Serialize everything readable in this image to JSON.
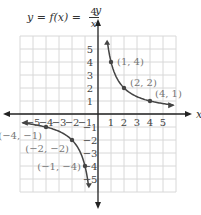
{
  "equation": {
    "lhs": "y = f(x) =",
    "numerator": "4",
    "denominator": "x"
  },
  "axes": {
    "x_label": "x",
    "y_label": "y",
    "x_ticks_pos": [
      "1",
      "2",
      "3",
      "4",
      "5"
    ],
    "x_ticks_neg": [
      "−5",
      "−4",
      "−3",
      "−2",
      "−1"
    ],
    "y_ticks_pos": [
      "1",
      "2",
      "3",
      "4",
      "5"
    ],
    "y_ticks_neg": [
      "−1",
      "−2",
      "−3",
      "−4",
      "−5"
    ]
  },
  "points": [
    {
      "label": "(1, 4)",
      "x": 1,
      "y": 4
    },
    {
      "label": "(2, 2)",
      "x": 2,
      "y": 2
    },
    {
      "label": "(4, 1)",
      "x": 4,
      "y": 1
    },
    {
      "label": "(−4, −1)",
      "x": -4,
      "y": -1
    },
    {
      "label": "(−2, −2)",
      "x": -2,
      "y": -2
    },
    {
      "label": "(−1, −4)",
      "x": -1,
      "y": -4
    }
  ],
  "colors": {
    "curve": "#444444",
    "grid": "#d8d8d8",
    "axis": "#222222",
    "label": "#777777"
  }
}
